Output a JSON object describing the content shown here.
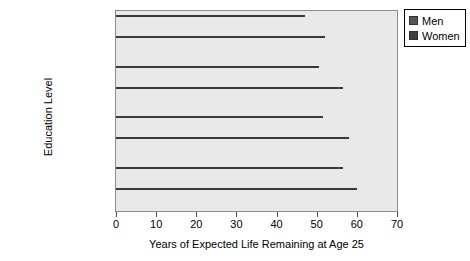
{
  "chart_data": {
    "type": "bar",
    "orientation": "horizontal",
    "title": "",
    "xlabel": "Years of Expected Life Remaining at Age 25",
    "ylabel": "Education Level",
    "xlim": [
      0,
      70
    ],
    "xticks": [
      0,
      10,
      20,
      30,
      40,
      50,
      60,
      70
    ],
    "grid": false,
    "legend_position": "top-right",
    "categories": [
      "No High School Diploma",
      "High School Graduate or GED",
      "Some College",
      "Bachelor's Degree or Higher"
    ],
    "category_lines": [
      [
        "No High School",
        "Diploma"
      ],
      [
        "High School",
        "Graduate or GED"
      ],
      [
        "Some College",
        ""
      ],
      [
        "Bachelor's",
        "Degree or Higher"
      ]
    ],
    "series": [
      {
        "name": "Men",
        "color": "#555555",
        "values": [
          47,
          50.5,
          51.5,
          56.5
        ]
      },
      {
        "name": "Women",
        "color": "#3f3f3f",
        "values": [
          52,
          56.5,
          58,
          60
        ]
      }
    ]
  },
  "legend": {
    "items": [
      {
        "label": "Men"
      },
      {
        "label": "Women"
      }
    ]
  },
  "axis": {
    "x_title": "Years of Expected Life Remaining at Age 25",
    "y_title": "Education Level",
    "x_tick_labels": [
      "0",
      "10",
      "20",
      "30",
      "40",
      "50",
      "60",
      "70"
    ]
  },
  "colors": {
    "plot_background": "#e9e9e9",
    "plot_border": "#8c8c8c",
    "men_bar": "#555555",
    "women_bar": "#3f3f3f",
    "page_background": "#ffffff"
  }
}
